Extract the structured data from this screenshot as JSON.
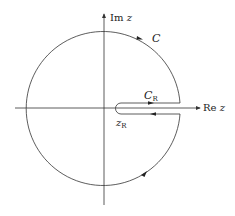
{
  "diagram": {
    "type": "keyhole contour in complex plane",
    "axes": {
      "imag_label_prefix": "Im",
      "imag_label_var": "z",
      "real_label_prefix": "Re",
      "real_label_var": "z"
    },
    "labels": {
      "outer_contour": "C",
      "inner_contour_main": "C",
      "inner_contour_sub": "R",
      "point_main": "z",
      "point_sub": "R"
    },
    "colors": {
      "stroke": "#333333",
      "text": "#222222",
      "background": "#ffffff"
    }
  }
}
